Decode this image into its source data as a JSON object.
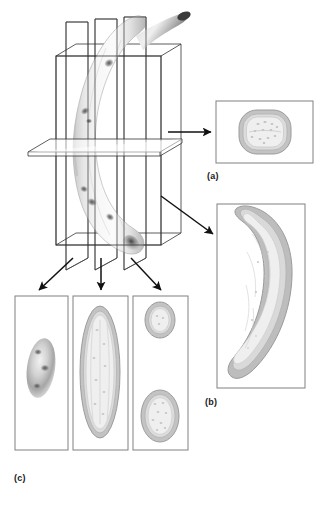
{
  "figure": {
    "background_color": "#ffffff"
  },
  "panels": [
    {
      "id": "a",
      "label": "(a)",
      "caption_label": "(a)",
      "content": "transverse-cross-section",
      "description": "Rounded rectangular transverse cross-section of banana showing peel ring and speckled pulp",
      "frame": {
        "x": 216,
        "y": 101,
        "width": 97,
        "height": 62
      }
    },
    {
      "id": "b",
      "label": "(b)",
      "caption_label": "(b)",
      "content": "longitudinal-crescent-section",
      "description": "Full-length longitudinal section showing crescent shaped banana with peel outline and pulp",
      "frame": {
        "x": 217,
        "y": 204,
        "width": 88,
        "height": 184
      }
    },
    {
      "id": "c",
      "label": "(c)",
      "caption_label": "(c)",
      "content": "three-sagittal-sections",
      "description": "Three vertical slice panels: outer surface view, mid-plane elongated section, and off-centre double section",
      "frames": [
        {
          "x": 15,
          "y": 296,
          "width": 53,
          "height": 154,
          "content": "surface-silhouette"
        },
        {
          "x": 73,
          "y": 296,
          "width": 55,
          "height": 154,
          "content": "mid-plane-ellipse-section"
        },
        {
          "x": 133,
          "y": 296,
          "width": 55,
          "height": 154,
          "content": "two-separated-sections"
        }
      ]
    }
  ],
  "planes": {
    "vertical_slice_count": 3,
    "large_vertical_plane": 1,
    "horizontal_plane": 1,
    "description": "Three thin sagittal cutting planes plus one large vertical plane and one horizontal transverse plane pass through the banana"
  },
  "arrows": [
    {
      "name": "arrow-to-panel-a",
      "from": "horizontal-plane",
      "to": "panel-a",
      "direction": "right"
    },
    {
      "name": "arrow-to-panel-b",
      "from": "large-vertical-plane",
      "to": "panel-b",
      "direction": "down-right"
    },
    {
      "name": "arrow-to-panel-c1",
      "from": "slice-plane-1",
      "to": "panel-c-left",
      "direction": "down-left"
    },
    {
      "name": "arrow-to-panel-c2",
      "from": "slice-plane-2",
      "to": "panel-c-middle",
      "direction": "down"
    },
    {
      "name": "arrow-to-panel-c3",
      "from": "slice-plane-3",
      "to": "panel-c-right",
      "direction": "down-right"
    }
  ],
  "colors": {
    "stroke": "#1a1a1a",
    "frame_border": "#808080",
    "peel_outer": "#a8a8a8",
    "peel_inner": "#cccccc",
    "pulp": "#eeeeee",
    "pulp_speckle": "#bdbdbd",
    "background": "#ffffff"
  }
}
